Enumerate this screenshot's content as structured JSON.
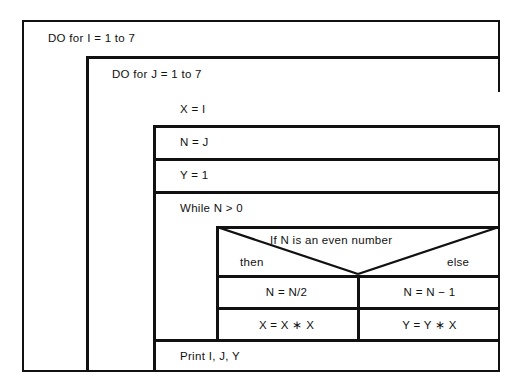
{
  "diagram": {
    "type": "nassi-shneiderman-structogram",
    "outer_loop": {
      "label": "DO for I = 1 to 7"
    },
    "inner_loop": {
      "label": "DO for J = 1 to 7"
    },
    "statements": [
      {
        "label": "X = I"
      },
      {
        "label": "N = J"
      },
      {
        "label": "Y = 1"
      }
    ],
    "while_block": {
      "label": "While N > 0",
      "condition": {
        "label": "If N is an even number",
        "then_label": "then",
        "else_label": "else"
      },
      "then_branch": [
        {
          "label": "N = N/2"
        },
        {
          "label": "X = X ∗ X"
        }
      ],
      "else_branch": [
        {
          "label": "N = N − 1"
        },
        {
          "label": "Y = Y ∗ X"
        }
      ]
    },
    "print_statement": {
      "label": "Print I, J, Y"
    },
    "colors": {
      "line": "#111111",
      "background": "#ffffff"
    }
  }
}
